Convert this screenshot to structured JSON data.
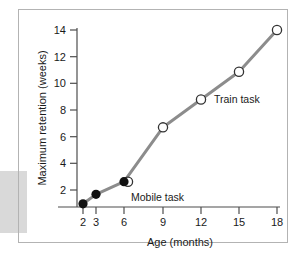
{
  "chart_data": {
    "type": "line",
    "title": "",
    "xlabel": "Age (months)",
    "ylabel": "Maximum retention (weeks)",
    "x": [
      2,
      3,
      6,
      9,
      12,
      15,
      18
    ],
    "xticklabels": [
      "2",
      "3",
      "6",
      "9",
      "12",
      "15",
      "18"
    ],
    "yticks": [
      2,
      4,
      6,
      8,
      10,
      12,
      14
    ],
    "yticklabels": [
      "2",
      "4",
      "6",
      "8",
      "10",
      "12",
      "14"
    ],
    "ylim": [
      0,
      14.8
    ],
    "grid": false,
    "legend_position": "inline-annotations",
    "line_color": "#8c8c8c",
    "series": [
      {
        "name": "Maximum retention",
        "values": [
          0.25,
          1.0,
          2.0,
          6.3,
          8.5,
          10.7,
          14.0
        ],
        "marker_styles": [
          "filled",
          "filled",
          "filled-and-open",
          "open",
          "open",
          "open",
          "open"
        ]
      }
    ],
    "annotations": [
      {
        "text": "Mobile task",
        "x": 6.6,
        "y": 1.1
      },
      {
        "text": "Train task",
        "x": 14.0,
        "y": 8.9
      }
    ]
  },
  "axes": {
    "y_title": "Maximum retention (weeks)",
    "x_title": "Age (months)",
    "y_tick_labels": [
      "14",
      "12",
      "10",
      "8",
      "6",
      "4",
      "2"
    ],
    "x_tick_labels": [
      "2",
      "3",
      "6",
      "9",
      "12",
      "15",
      "18"
    ]
  },
  "annotations": {
    "mobile_task": "Mobile task",
    "train_task": "Train task"
  },
  "colors": {
    "line": "#8c8c8c",
    "marker_filled": "#111111",
    "marker_open_fill": "#ffffff",
    "marker_open_stroke": "#333333",
    "axis": "#4d4d4d",
    "border": "#b3b3b3",
    "gray_block": "#d9d9d9",
    "text": "#1a1a1a"
  }
}
